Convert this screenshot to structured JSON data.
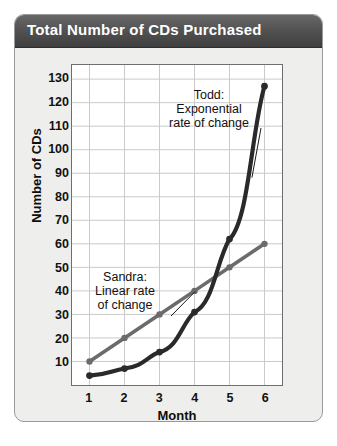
{
  "card": {
    "title": "Total Number of CDs Purchased"
  },
  "chart_data": {
    "type": "line",
    "title": "Total Number of CDs Purchased",
    "xlabel": "Month",
    "ylabel": "Number of CDs",
    "x": [
      1,
      2,
      3,
      4,
      5,
      6
    ],
    "xlim": [
      0.5,
      6.5
    ],
    "ylim": [
      0,
      136
    ],
    "xticks": [
      "1",
      "2",
      "3",
      "4",
      "5",
      "6"
    ],
    "yticks": [
      "10",
      "20",
      "30",
      "40",
      "50",
      "60",
      "70",
      "80",
      "90",
      "100",
      "110",
      "120",
      "130"
    ],
    "ytick_values": [
      10,
      20,
      30,
      40,
      50,
      60,
      70,
      80,
      90,
      100,
      110,
      120,
      130
    ],
    "grid": true,
    "legend": "none",
    "series": [
      {
        "name": "Sandra",
        "values": [
          10,
          20,
          30,
          40,
          50,
          60
        ],
        "color": "#6b6b6b",
        "marker": "circle"
      },
      {
        "name": "Todd",
        "values": [
          4,
          7,
          14,
          31,
          62,
          127
        ],
        "color": "#2a2a2a",
        "marker": "circle"
      }
    ],
    "annotations": [
      {
        "name": "todd-annotation",
        "text": "Todd:\nExponential\nrate of change",
        "target_x": 5.62,
        "target_y": 88
      },
      {
        "name": "sandra-annotation",
        "text": "Sandra:\nLinear rate\nof change",
        "target_x": 4.02,
        "target_y": 40
      }
    ]
  }
}
